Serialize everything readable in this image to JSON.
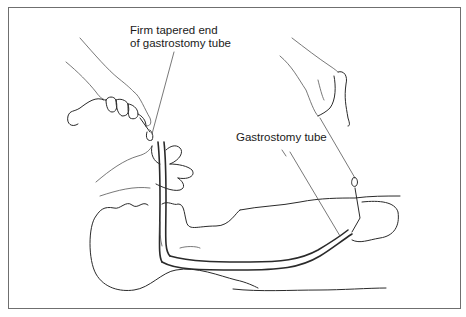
{
  "figure": {
    "labels": [
      {
        "id": "firm-tapered-end",
        "lines": [
          "Firm tapered end",
          "of gastrostomy tube"
        ]
      },
      {
        "id": "gastrostomy-tube",
        "lines": [
          "Gastrostomy tube"
        ]
      }
    ],
    "colors": {
      "line": "#2a2a2a",
      "frame": "#6f6f6f",
      "background": "#ffffff"
    }
  }
}
